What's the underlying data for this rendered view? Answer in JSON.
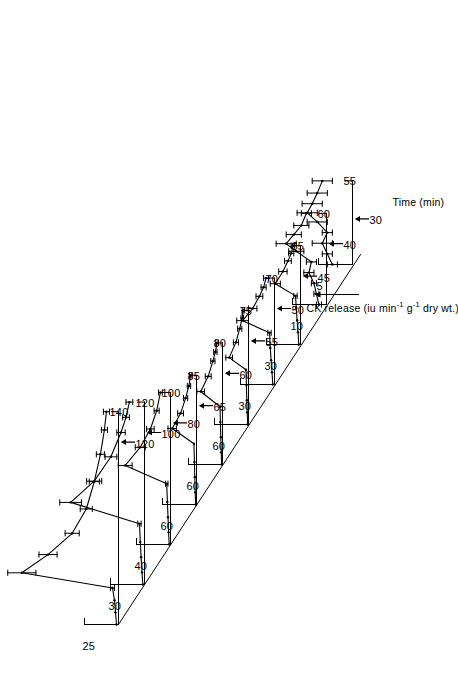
{
  "figure": {
    "orientation_deg": -90,
    "background": "#ffffff",
    "ink": "#000000"
  },
  "axes": {
    "x_title": "Time (min)",
    "y_title_prefix": "CK release (iu min",
    "y_title_sup1": "-1",
    "y_title_mid": " g",
    "y_title_sup2": "-1",
    "y_title_suffix": " dry wt.)"
  },
  "chart_data": {
    "type": "line",
    "title": "",
    "xlabel": "Time (min)",
    "ylabel": "CK release (iu min-1 g-1 dry wt.)",
    "grid": false,
    "legend": "none",
    "layout": "staggered offset stack of 10 traces, each with its own vertical scale bar and its own time axis; traces offset diagonally up-and-right",
    "series": [
      {
        "name": "trace-1",
        "y_scale_label": "25",
        "arrow_label": "120",
        "end_label": "140",
        "x": [
          0,
          8,
          16,
          24,
          34,
          46,
          60,
          76,
          94,
          112,
          128,
          140
        ],
        "y": [
          2,
          3,
          4,
          6,
          96,
          70,
          46,
          32,
          24,
          18,
          14,
          12
        ],
        "yerr": [
          1,
          1,
          1,
          2,
          14,
          9,
          7,
          6,
          5,
          4,
          3,
          3
        ]
      },
      {
        "name": "trace-2",
        "y_scale_label": "30",
        "arrow_label": "100",
        "end_label": "120",
        "x": [
          0,
          8,
          18,
          28,
          40,
          54,
          68,
          84,
          100,
          110,
          120
        ],
        "y": [
          2,
          3,
          4,
          5,
          6,
          88,
          60,
          40,
          28,
          22,
          18
        ],
        "yerr": [
          1,
          1,
          1,
          1,
          2,
          13,
          9,
          7,
          5,
          4,
          4
        ]
      },
      {
        "name": "trace-3",
        "y_scale_label": "40",
        "arrow_label": "80",
        "end_label": "100",
        "x": [
          0,
          8,
          18,
          28,
          40,
          52,
          64,
          76,
          88,
          100
        ],
        "y": [
          2,
          3,
          4,
          5,
          6,
          72,
          48,
          32,
          22,
          16
        ],
        "yerr": [
          1,
          1,
          1,
          1,
          2,
          11,
          8,
          6,
          4,
          3
        ]
      },
      {
        "name": "trace-4",
        "y_scale_label": "60",
        "arrow_label": "65",
        "end_label": "85",
        "x": [
          0,
          8,
          18,
          28,
          40,
          50,
          60,
          70,
          78,
          85
        ],
        "y": [
          2,
          3,
          4,
          5,
          6,
          58,
          38,
          26,
          18,
          14
        ],
        "yerr": [
          1,
          1,
          1,
          1,
          2,
          10,
          7,
          5,
          4,
          3
        ]
      },
      {
        "name": "trace-5",
        "y_scale_label": "60",
        "arrow_label": "60",
        "end_label": "80",
        "x": [
          0,
          8,
          18,
          28,
          38,
          48,
          58,
          68,
          74,
          80
        ],
        "y": [
          2,
          3,
          4,
          5,
          6,
          52,
          34,
          23,
          17,
          13
        ],
        "yerr": [
          1,
          1,
          1,
          1,
          2,
          9,
          7,
          5,
          4,
          3
        ]
      },
      {
        "name": "trace-6",
        "y_scale_label": "60",
        "arrow_label": "55",
        "end_label": "75",
        "x": [
          0,
          8,
          16,
          26,
          36,
          44,
          54,
          63,
          70,
          75
        ],
        "y": [
          2,
          3,
          4,
          5,
          6,
          46,
          30,
          21,
          15,
          12
        ],
        "yerr": [
          1,
          1,
          1,
          1,
          2,
          8,
          6,
          5,
          3,
          3
        ]
      },
      {
        "name": "trace-7",
        "y_scale_label": "30",
        "arrow_label": "50",
        "end_label": "70",
        "x": [
          0,
          8,
          16,
          24,
          34,
          42,
          50,
          58,
          64,
          70
        ],
        "y": [
          2,
          3,
          4,
          5,
          6,
          38,
          26,
          18,
          13,
          10
        ],
        "yerr": [
          1,
          1,
          1,
          1,
          2,
          7,
          5,
          4,
          3,
          3
        ]
      },
      {
        "name": "trace-8",
        "y_scale_label": "30",
        "arrow_label": "45",
        "end_label": "65",
        "x": [
          0,
          8,
          16,
          24,
          32,
          40,
          48,
          55,
          60,
          65
        ],
        "y": [
          2,
          3,
          4,
          5,
          6,
          30,
          21,
          15,
          11,
          9
        ],
        "yerr": [
          1,
          1,
          1,
          1,
          2,
          6,
          5,
          4,
          3,
          2
        ]
      },
      {
        "name": "trace-9",
        "y_scale_label": "10",
        "arrow_label": "40",
        "end_label": "60",
        "x": [
          0,
          7,
          14,
          21,
          28,
          35,
          40,
          46,
          52,
          60
        ],
        "y": [
          3,
          4,
          5,
          7,
          6,
          12,
          16,
          13,
          10,
          8
        ],
        "yerr": [
          1,
          1,
          1,
          2,
          2,
          3,
          4,
          3,
          3,
          2
        ]
      },
      {
        "name": "trace-10",
        "y_scale_label": "5",
        "arrow_label": "30",
        "end_label": "55",
        "x": [
          0,
          7,
          14,
          21,
          28,
          34,
          40,
          47,
          55
        ],
        "y": [
          4,
          5,
          6,
          5,
          7,
          9,
          8,
          7,
          6
        ],
        "yerr": [
          1,
          1,
          2,
          1,
          2,
          2,
          2,
          2,
          2
        ]
      }
    ],
    "y_scale_labels": [
      "25",
      "30",
      "40",
      "60",
      "60",
      "60",
      "30",
      "30",
      "10",
      "5"
    ],
    "arrow_labels": [
      "120",
      "100",
      "80",
      "65",
      "60",
      "55",
      "50",
      "45",
      "40",
      "30"
    ],
    "end_labels": [
      "140",
      "120",
      "100",
      "85",
      "80",
      "75",
      "70",
      "65",
      "60",
      "55"
    ]
  }
}
